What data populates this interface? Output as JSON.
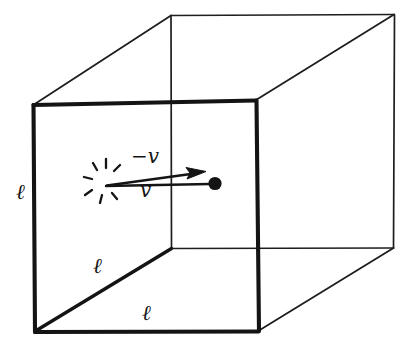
{
  "figure": {
    "name": "cube-with-velocity-vector",
    "background_color": "#ffffff",
    "ink_color": "#141414",
    "width": 417,
    "height": 353
  },
  "labels": {
    "edge_left": "ℓ",
    "edge_depth": "ℓ",
    "edge_bottom": "ℓ",
    "velocity_incoming": "−v",
    "velocity_outgoing": "v"
  },
  "geometry": {
    "front_face": {
      "top_left": [
        33,
        105
      ],
      "top_right": [
        256,
        100
      ],
      "bottom_right": [
        259,
        331
      ],
      "bottom_left": [
        35,
        332
      ],
      "stroke_width": 4
    },
    "back_face": {
      "top_left": [
        171,
        15
      ],
      "top_right": [
        394,
        15
      ],
      "bottom_right": [
        394,
        248
      ],
      "bottom_left": [
        171,
        248
      ],
      "stroke_width": 1.6
    },
    "connectors": [
      [
        [
          33,
          105
        ],
        [
          171,
          15
        ]
      ],
      [
        [
          256,
          100
        ],
        [
          394,
          15
        ]
      ],
      [
        [
          259,
          331
        ],
        [
          394,
          248
        ]
      ],
      [
        [
          35,
          332
        ],
        [
          171,
          248
        ]
      ]
    ],
    "collision_point": [
      105,
      183
    ],
    "particle_dot": {
      "center": [
        215,
        183
      ],
      "radius": 6.5
    },
    "arrow": {
      "start": [
        107,
        185
      ],
      "tip": [
        205,
        172
      ]
    },
    "starburst": {
      "center": [
        105,
        183
      ],
      "ray_count": 7,
      "inner_radius": 8,
      "outer_radius": 17
    }
  }
}
